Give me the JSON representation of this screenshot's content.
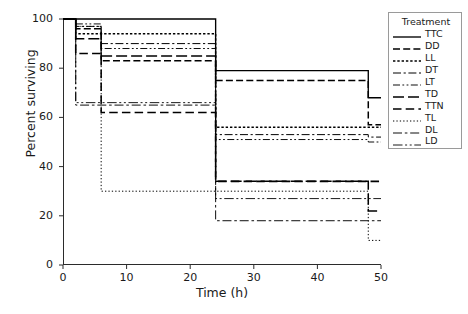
{
  "chart_data": {
    "type": "line",
    "title": "",
    "xlabel": "Time (h)",
    "ylabel": "Percent surviving",
    "xlim": [
      0,
      50
    ],
    "ylim": [
      0,
      100
    ],
    "xticks": [
      0,
      10,
      20,
      30,
      40,
      50
    ],
    "yticks": [
      0,
      20,
      40,
      60,
      80,
      100
    ],
    "grid": false,
    "legend_position": "right-outside",
    "legend_title": "Treatment",
    "step_style": "post",
    "x": [
      0,
      2,
      6,
      24,
      48,
      50
    ],
    "series": [
      {
        "name": "TTC",
        "label": "TTC",
        "dash": "solid",
        "values": [
          100,
          100,
          100,
          79,
          68,
          68
        ]
      },
      {
        "name": "DD",
        "label": "DD",
        "dash": "dashed",
        "values": [
          100,
          96,
          83,
          75,
          57,
          57
        ]
      },
      {
        "name": "LL",
        "label": "LL",
        "dash": "dotted",
        "values": [
          100,
          94,
          94,
          56,
          56,
          56
        ]
      },
      {
        "name": "DT",
        "label": "DT",
        "dash": "dashdot",
        "values": [
          100,
          97,
          90,
          53,
          52,
          52
        ]
      },
      {
        "name": "LT",
        "label": "LT",
        "dash": "dashdotdot",
        "values": [
          100,
          98,
          88,
          51,
          50,
          50
        ]
      },
      {
        "name": "TD",
        "label": "TD",
        "dash": "longdash",
        "values": [
          100,
          92,
          85,
          34,
          22,
          22
        ]
      },
      {
        "name": "TTN",
        "label": "TTN",
        "dash": "widedash",
        "values": [
          100,
          86,
          62,
          34,
          34,
          34
        ]
      },
      {
        "name": "TL",
        "label": "TL",
        "dash": "finedot",
        "values": [
          100,
          97,
          30,
          30,
          10,
          10
        ]
      },
      {
        "name": "DL",
        "label": "DL",
        "dash": "dashdotlong",
        "values": [
          100,
          65,
          65,
          18,
          18,
          18
        ]
      },
      {
        "name": "LD",
        "label": "LD",
        "dash": "dashdotdot2",
        "values": [
          100,
          66,
          66,
          27,
          27,
          27
        ]
      }
    ]
  }
}
